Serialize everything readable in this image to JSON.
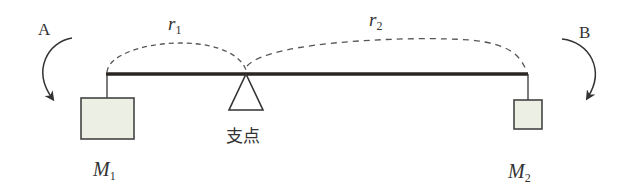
{
  "diagram": {
    "type": "lever-balance",
    "labels": {
      "moment_a": "A",
      "moment_b": "B",
      "r1_main": "r",
      "r1_sub": "1",
      "r2_main": "r",
      "r2_sub": "2",
      "m1_main": "M",
      "m1_sub": "1",
      "m2_main": "M",
      "m2_sub": "2",
      "fulcrum": "支点"
    },
    "colors": {
      "beam": "#2a2520",
      "line": "#333333",
      "mass_fill": "#ecefe4",
      "mass_stroke": "#444444",
      "dashed": "#555555"
    }
  }
}
